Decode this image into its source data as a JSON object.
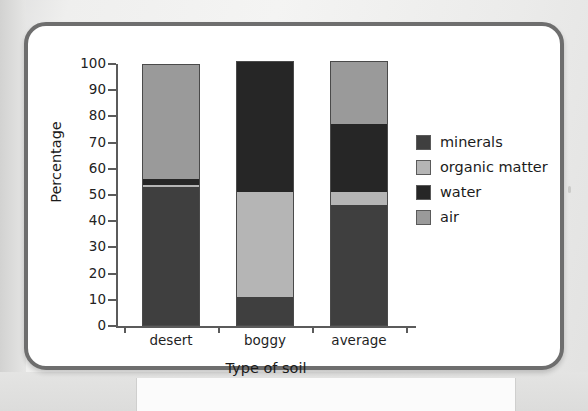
{
  "chart_data": {
    "type": "bar",
    "subtype": "stacked-bar",
    "title": "",
    "xlabel": "Type of soil",
    "ylabel": "Percentage",
    "categories": [
      "desert",
      "boggy",
      "average"
    ],
    "ylim": [
      0,
      100
    ],
    "yticks": [
      0,
      10,
      20,
      30,
      40,
      50,
      60,
      70,
      80,
      90,
      100
    ],
    "ytick_labels": [
      "0",
      "10",
      "20",
      "30",
      "40",
      "50",
      "60",
      "70",
      "80",
      "90",
      "100"
    ],
    "grid": false,
    "legend_position": "right",
    "stack_order_bottom_to_top": [
      "minerals",
      "organic matter",
      "water",
      "air"
    ],
    "series": [
      {
        "name": "minerals",
        "color": "#3f3f3f",
        "values": [
          53,
          11,
          46
        ]
      },
      {
        "name": "organic matter",
        "color": "#b5b5b5",
        "values": [
          1,
          40,
          5
        ]
      },
      {
        "name": "water",
        "color": "#262626",
        "values": [
          2,
          50,
          26
        ]
      },
      {
        "name": "air",
        "color": "#9a9a9a",
        "values": [
          44,
          0,
          24
        ]
      }
    ],
    "bar_totals": [
      100,
      101,
      101
    ]
  },
  "legend": {
    "items": [
      {
        "label": "minerals",
        "color": "#3f3f3f"
      },
      {
        "label": "organic matter",
        "color": "#b5b5b5"
      },
      {
        "label": "water",
        "color": "#262626"
      },
      {
        "label": "air",
        "color": "#9a9a9a"
      }
    ]
  },
  "axes": {
    "y_title": "Percentage",
    "x_title": "Type of soil",
    "y_tick_labels": [
      "100",
      "90",
      "80",
      "70",
      "60",
      "50",
      "40",
      "30",
      "20",
      "10",
      "0"
    ],
    "x_tick_labels": [
      "desert",
      "boggy",
      "average"
    ]
  }
}
